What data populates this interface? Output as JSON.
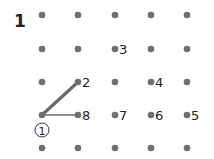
{
  "puzzle": {
    "number": "1",
    "start_label": "1",
    "dot_color": "#707070",
    "line_color": "#6a6a6a",
    "grid": {
      "cols_x": [
        42,
        78,
        115,
        151,
        187
      ],
      "rows_y": [
        15,
        49,
        82,
        115,
        148
      ]
    },
    "labels": [
      {
        "text": "2",
        "col": 1,
        "row": 2
      },
      {
        "text": "3",
        "col": 2,
        "row": 1
      },
      {
        "text": "4",
        "col": 3,
        "row": 2
      },
      {
        "text": "5",
        "col": 4,
        "row": 3
      },
      {
        "text": "6",
        "col": 3,
        "row": 3
      },
      {
        "text": "7",
        "col": 2,
        "row": 3
      },
      {
        "text": "8",
        "col": 1,
        "row": 3
      }
    ],
    "segments": [
      {
        "from": [
          0,
          3
        ],
        "to": [
          1,
          2
        ],
        "weight": "thick"
      },
      {
        "from": [
          0,
          3
        ],
        "to": [
          1,
          3
        ],
        "weight": "thin"
      }
    ]
  }
}
